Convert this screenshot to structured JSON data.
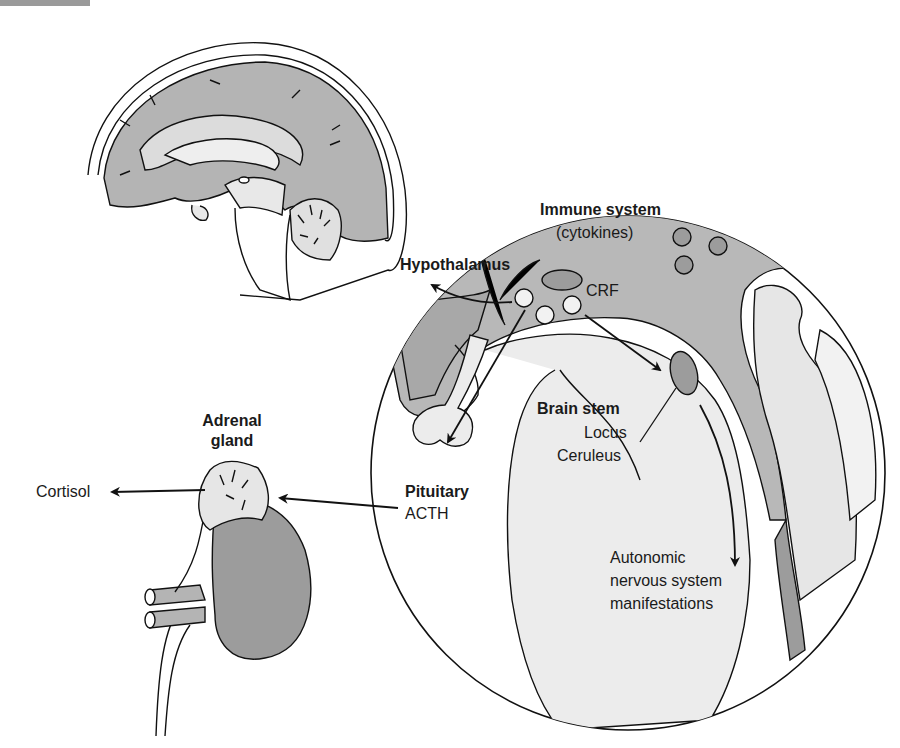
{
  "diagram": {
    "type": "anatomical illustration",
    "colors": {
      "tissue_light": "#e6e6e6",
      "tissue_mid": "#b4b4b4",
      "tissue_dark": "#9c9c9c",
      "line": "#111111"
    },
    "labels": {
      "immune_system": "Immune system",
      "cytokines": "(cytokines)",
      "hypothalamus": "Hypothalamus",
      "crf": "CRF",
      "brain_stem": "Brain stem",
      "locus": "Locus",
      "ceruleus": "Ceruleus",
      "pituitary": "Pituitary",
      "acth": "ACTH",
      "adrenal": "Adrenal",
      "gland": "gland",
      "cortisol": "Cortisol",
      "autonomic": "Autonomic",
      "nervous_system": "nervous system",
      "manifestations": "manifestations"
    },
    "arrows": [
      {
        "from": "Hypothalamus",
        "to": "Pituitary",
        "label": "CRF"
      },
      {
        "from": "Hypothalamus",
        "to": "Brain stem (Locus Ceruleus)"
      },
      {
        "from": "Pituitary",
        "to": "Adrenal gland",
        "label": "ACTH"
      },
      {
        "from": "Adrenal gland",
        "to": "Cortisol"
      },
      {
        "from": "Locus Ceruleus",
        "to": "Autonomic nervous system manifestations"
      }
    ]
  }
}
